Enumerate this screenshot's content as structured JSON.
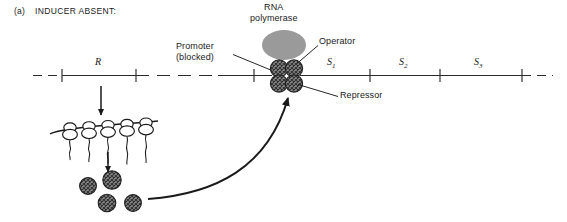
{
  "figure": {
    "panel_tag": "(a)",
    "panel_title": "INDUCER ABSENT:",
    "type": "biology-diagram"
  },
  "labels": {
    "rna_polymerase_line1": "RNA",
    "rna_polymerase_line2": "polymerase",
    "promoter_line1": "Promoter",
    "promoter_line2": "(blocked)",
    "operator": "Operator",
    "repressor": "Repressor"
  },
  "dna": {
    "genes": [
      {
        "id": "R",
        "label": "R",
        "sub": ""
      },
      {
        "id": "S1",
        "label": "S",
        "sub": "1"
      },
      {
        "id": "S2",
        "label": "S",
        "sub": "2"
      },
      {
        "id": "S3",
        "label": "S",
        "sub": "3"
      }
    ]
  },
  "colors": {
    "ink": "#1a1a1a",
    "line": "#2b2b2b",
    "polymerase_fill": "#9a9a9a",
    "repressor_fill": "#6e6e6e",
    "background": "#ffffff"
  },
  "elements": {
    "polysome_ribosome_count": 5,
    "free_repressor_subunit_count": 4,
    "bound_repressor_subunit_count": 4,
    "transcription_arrow": "down",
    "translation_arrow": "down",
    "assembly_arrow": "curved-up-right"
  }
}
